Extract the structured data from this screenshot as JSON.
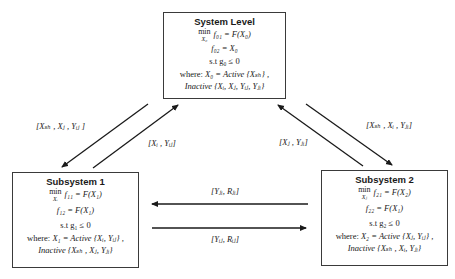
{
  "system_level": {
    "title": "System Level",
    "min_op": "min",
    "min_sub": "X₀",
    "objective": "f₀₁ = F(X₀)",
    "eq2": "f₀₂ = X₀",
    "constraint": "s.t g₀ ≤ 0",
    "where_label": "where:",
    "where_expr": "X₀ = Active {Xₛₕ} ,",
    "inactive": "Inactive {Xᵢ, Xⱼ, Yᵢⱼ, Yⱼᵢ}"
  },
  "subsystem_1": {
    "title": "Subsystem 1",
    "min_op": "min",
    "min_sub": "Xᵢ",
    "objective": "f₁₁ = F(X₁)",
    "eq2": "f₁₂ = F(X₁)",
    "constraint": "s.t g₁ ≤ 0",
    "where_label": "where:",
    "where_expr": "X₁ = Active {Xᵢ, Yᵢⱼ} ,",
    "inactive": "Inactive {Xₛₕ , Xⱼ, Yⱼᵢ}"
  },
  "subsystem_2": {
    "title": "Subsystem 2",
    "min_op": "min",
    "min_sub": "Xⱼ",
    "objective": "f₂₁ = F(X₂)",
    "eq2": "f₂₂ = F(X₁)",
    "constraint": "s.t g₂ ≤ 0",
    "where_label": "where:",
    "where_expr": "X₂ = Active {Xⱼ, Yᵢⱼ} ,",
    "inactive": "Inactive {Xₛₕ , Xᵢ, Yⱼᵢ}"
  },
  "edges": {
    "sys_to_sub1": "[Xₛₕ , Xⱼ , Yᵢⱼ ]",
    "sub1_to_sys": "[Xᵢ , Yᵢⱼ]",
    "sub2_to_sys": "[Xⱼ , Yⱼᵢ]",
    "sys_to_sub2": "[Xₛₕ , Xᵢ , Yⱼᵢ]",
    "sub2_to_sub1": "[Yⱼᵢ, Rⱼᵢ]",
    "sub1_to_sub2": "[Yᵢⱼ, Rᵢⱼ]"
  },
  "colors": {
    "border": "#3a3a3a",
    "arrow": "#1a1a1a",
    "background": "#ffffff"
  }
}
